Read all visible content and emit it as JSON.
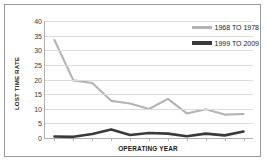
{
  "chart_data": {
    "type": "line",
    "title": "",
    "xlabel": "OPERATING YEAR",
    "ylabel": "LOST TIME RATE",
    "ylim": [
      0,
      40
    ],
    "yticks": [
      40,
      35,
      30,
      25,
      20,
      15,
      10,
      5,
      0
    ],
    "grid": true,
    "xtick_labels": [],
    "n_points": 11,
    "legend_position": "top-right",
    "series": [
      {
        "name": "1968 TO 1978",
        "color": "#b4b4b4",
        "values": [
          33.5,
          19.7,
          18.8,
          12.7,
          11.8,
          9.9,
          13.4,
          8.4,
          9.8,
          8.0,
          8.2
        ]
      },
      {
        "name": "1999 TO 2009",
        "color": "#3a3a3a",
        "values": [
          0.5,
          0.4,
          1.4,
          2.9,
          1.0,
          1.7,
          1.5,
          0.6,
          1.5,
          0.9,
          2.2
        ]
      }
    ]
  },
  "legend": {
    "entries": [
      {
        "label": "1968 TO 1978",
        "color": "#b4b4b4"
      },
      {
        "label": "1999 TO 2009",
        "color": "#3a3a3a"
      }
    ]
  },
  "axes": {
    "y_title": "LOST TIME RATE",
    "x_title": "OPERATING YEAR"
  },
  "colors": {
    "series_light": "#b4b4b4",
    "series_dark": "#3a3a3a",
    "gridline": "#dcdcdc",
    "axis": "#b0b0b0",
    "frame": "#9b9b9b",
    "background": "#ffffff",
    "tick_text": "#3a3a3a"
  }
}
